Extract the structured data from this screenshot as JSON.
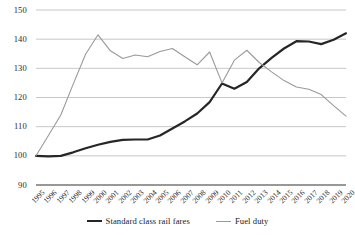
{
  "chart_data": {
    "type": "line",
    "title": "",
    "subtitle": "",
    "xlabel": "",
    "ylabel": "",
    "xlim": [
      1995,
      2020
    ],
    "ylim": [
      90,
      150
    ],
    "yticks": [
      90,
      100,
      110,
      120,
      130,
      140,
      150
    ],
    "grid": true,
    "legend_position": "bottom",
    "x": [
      1995,
      1996,
      1997,
      1998,
      1999,
      2000,
      2001,
      2002,
      2003,
      2004,
      2005,
      2006,
      2007,
      2008,
      2009,
      2010,
      2011,
      2012,
      2013,
      2014,
      2015,
      2016,
      2017,
      2018,
      2019,
      2020
    ],
    "categories": [
      "1995",
      "1996",
      "1997",
      "1998",
      "1999",
      "2000",
      "2001",
      "2002",
      "2003",
      "2004",
      "2005",
      "2006",
      "2007",
      "2008",
      "2009",
      "2010",
      "2011",
      "2012",
      "2013",
      "2014",
      "2015",
      "2016",
      "2017",
      "2018",
      "2019",
      "2020"
    ],
    "series": [
      {
        "name": "Standard class rail fares",
        "color": "#262626",
        "width": 2.2,
        "values": [
          100.0,
          99.8,
          100.0,
          101.2,
          102.6,
          103.8,
          104.8,
          105.5,
          105.6,
          105.6,
          107.0,
          109.4,
          111.8,
          114.5,
          118.4,
          124.8,
          123.0,
          125.3,
          130.0,
          133.6,
          136.8,
          139.3,
          139.2,
          138.3,
          139.8,
          142.0
        ]
      },
      {
        "name": "Fuel duty",
        "color": "#9a9a9a",
        "width": 1.1,
        "values": [
          100.0,
          107.0,
          114.0,
          124.6,
          134.8,
          141.5,
          136.0,
          133.4,
          134.6,
          134.0,
          135.8,
          136.8,
          134.0,
          131.2,
          135.6,
          125.0,
          132.8,
          136.2,
          132.0,
          128.8,
          125.8,
          123.6,
          122.8,
          121.0,
          117.2,
          113.6
        ]
      }
    ]
  },
  "legend": {
    "entries": [
      {
        "label": "Standard class rail fares",
        "swatch": "thick-black-line"
      },
      {
        "label": "Fuel duty",
        "swatch": "thin-gray-line"
      }
    ]
  },
  "colors": {
    "rail_fares": "#262626",
    "fuel_duty": "#9a9a9a",
    "gridline": "#b9b9b9",
    "axis": "#333333",
    "text": "#2b2b2b",
    "background": "#ffffff"
  }
}
